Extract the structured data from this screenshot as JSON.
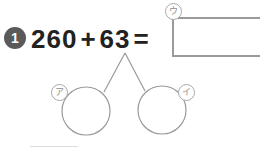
{
  "worksheet": {
    "width": 260,
    "height": 151,
    "background": "#ffffff"
  },
  "problem": {
    "number_badge": "1",
    "badge_color": "#5a5a5a",
    "badge_text_color": "#ffffff",
    "equation": {
      "first_operand": "260",
      "operator": "+",
      "second_operand": "63",
      "equals": "=",
      "full_text": "260 + 63 =",
      "text_color": "#222222"
    },
    "answer_box": {
      "value": "",
      "placeholder": "",
      "border_color": "#9a9a9a"
    }
  },
  "markers": {
    "answer_box_label": "ウ",
    "left_circle_label": "ア",
    "right_circle_label": "イ",
    "marker_color": "#8e8e8e",
    "marker_border_color": "#a8a8a8"
  },
  "decomposition": {
    "stroke_color": "#9a9a9a",
    "apex": {
      "x": 125,
      "y": 53
    },
    "left_circle": {
      "cx": 86,
      "cy": 111,
      "r": 24,
      "value": ""
    },
    "right_circle": {
      "cx": 162,
      "cy": 110,
      "r": 24,
      "value": ""
    }
  }
}
